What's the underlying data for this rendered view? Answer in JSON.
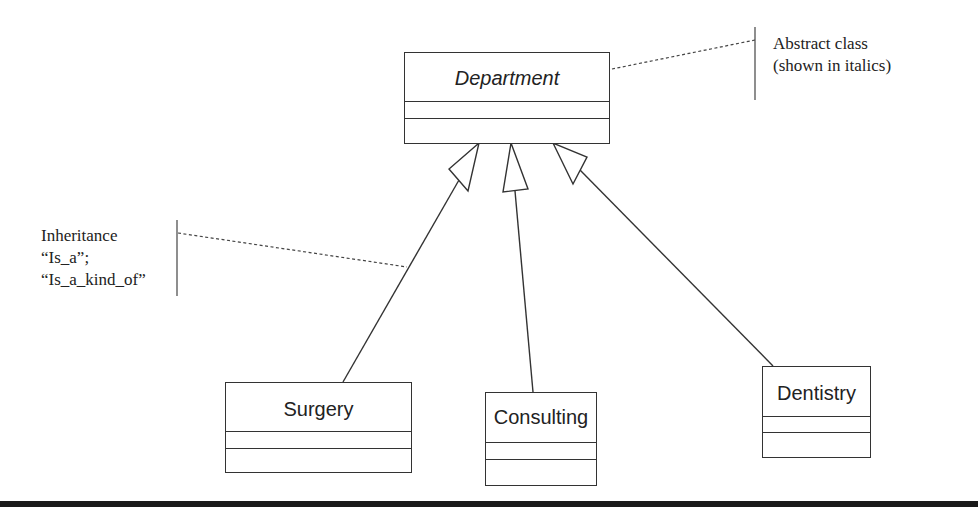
{
  "diagram": {
    "type": "UML class diagram",
    "classes": {
      "parent": {
        "name": "Department",
        "abstract": true
      },
      "children": [
        {
          "name": "Surgery"
        },
        {
          "name": "Consulting"
        },
        {
          "name": "Dentistry"
        }
      ]
    },
    "relationships": [
      {
        "from": "Surgery",
        "to": "Department",
        "kind": "generalization"
      },
      {
        "from": "Consulting",
        "to": "Department",
        "kind": "generalization"
      },
      {
        "from": "Dentistry",
        "to": "Department",
        "kind": "generalization"
      }
    ],
    "annotations": {
      "abstract_note": {
        "lines": [
          "Abstract class",
          "(shown in italics)"
        ]
      },
      "inheritance_note": {
        "lines": [
          "Inheritance",
          "“Is_a”;",
          "“Is_a_kind_of”"
        ]
      }
    },
    "colors": {
      "stroke": "#333333",
      "text": "#222222",
      "background": "#ffffff"
    }
  }
}
